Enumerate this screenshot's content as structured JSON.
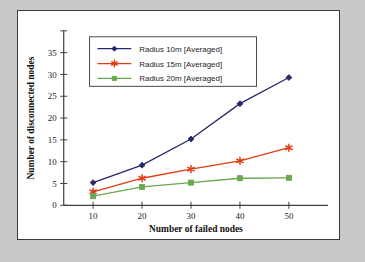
{
  "chart_data": {
    "type": "line",
    "title": "",
    "xlabel": "Number of failed nodes",
    "ylabel": "Number of disconnected nodes",
    "x": [
      10,
      20,
      30,
      40,
      50
    ],
    "xtick_labels": [
      "10",
      "20",
      "30",
      "40",
      "50"
    ],
    "ytick_labels": [
      "0",
      "5",
      "10",
      "15",
      "20",
      "25",
      "30",
      "35"
    ],
    "ytick_values": [
      0,
      5,
      10,
      15,
      20,
      25,
      30,
      35
    ],
    "xlim": [
      4,
      58
    ],
    "ylim": [
      0,
      40
    ],
    "grid": false,
    "legend_position": "upper-left-inside",
    "series": [
      {
        "name": "Radius 10m [Averaged]",
        "color": "#27286b",
        "marker": "diamond",
        "values": [
          5.2,
          9.2,
          15.2,
          23.3,
          29.3
        ]
      },
      {
        "name": "Radius 15m [Averaged]",
        "color": "#e23c12",
        "marker": "star",
        "values": [
          3.1,
          6.2,
          8.3,
          10.2,
          13.2
        ]
      },
      {
        "name": "Radius 20m [Averaged]",
        "color": "#6aa84f",
        "marker": "square",
        "values": [
          2.1,
          4.2,
          5.2,
          6.2,
          6.3
        ]
      }
    ]
  },
  "figure": {
    "background": "#ffffff",
    "border_color": "#3a3a3a",
    "page_background": "#c9c9c9"
  }
}
